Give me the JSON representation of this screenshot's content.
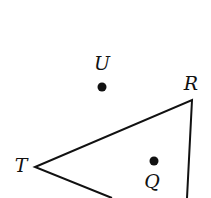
{
  "diagram": {
    "type": "geometry-figure",
    "shape": "triangle",
    "colors": {
      "stroke": "#111111",
      "background": "#ffffff"
    },
    "vertices": [
      {
        "name": "T",
        "x": 35,
        "y": 167,
        "label_x": 21,
        "label_y": 165
      },
      {
        "name": "R",
        "x": 192,
        "y": 100,
        "label_x": 191,
        "label_y": 83
      }
    ],
    "edges_offscreen": [
      {
        "from": "T",
        "to_x": 112,
        "to_y": 198
      },
      {
        "from": "R",
        "to_x": 187,
        "to_y": 198
      }
    ],
    "points": [
      {
        "name": "U",
        "x": 102,
        "y": 87,
        "label_x": 102,
        "label_y": 63,
        "position": "outside triangle"
      },
      {
        "name": "Q",
        "x": 154,
        "y": 161,
        "label_x": 152,
        "label_y": 181,
        "position": "inside triangle"
      }
    ],
    "labels": {
      "T": "T",
      "R": "R",
      "U": "U",
      "Q": "Q"
    }
  }
}
